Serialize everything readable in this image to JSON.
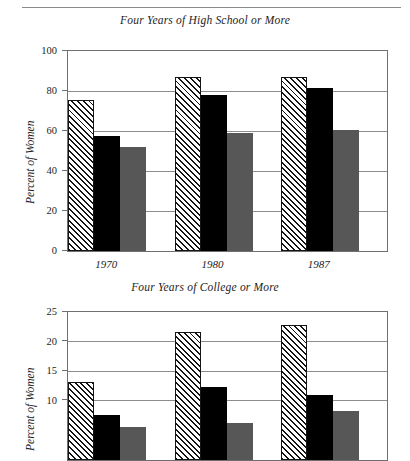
{
  "page": {
    "divider": "horizontal-rule"
  },
  "chart_data": [
    {
      "id": "high-school",
      "type": "bar",
      "title": "Four Years of High School or More",
      "xlabel": "",
      "ylabel": "Percent of Women",
      "ylim": [
        0,
        100
      ],
      "yticks": [
        0,
        20,
        40,
        60,
        80,
        100
      ],
      "ytick_labels": [
        "0",
        "20",
        "40",
        "60",
        "80",
        "100"
      ],
      "grid": true,
      "legend": "none",
      "categories": [
        "1970",
        "1980",
        "1987"
      ],
      "series": [
        {
          "name": "series-1",
          "style": "hatched",
          "color": "#ffffff",
          "values": [
            75.5,
            87.0,
            87.0
          ]
        },
        {
          "name": "series-2",
          "style": "solid-black",
          "color": "#000000",
          "values": [
            57.6,
            78.0,
            81.5
          ]
        },
        {
          "name": "series-3",
          "style": "solid-gray",
          "color": "#575757",
          "values": [
            52.0,
            58.8,
            60.6
          ]
        }
      ]
    },
    {
      "id": "college",
      "type": "bar",
      "title": "Four Years of College or More",
      "xlabel": "",
      "ylabel": "Percent of Women",
      "ylim": [
        0,
        25
      ],
      "yticks": [
        10,
        15,
        20,
        25
      ],
      "ytick_labels": [
        "10",
        "15",
        "20",
        "25"
      ],
      "grid": true,
      "legend": "none",
      "categories": [
        "1970",
        "1980",
        "1987"
      ],
      "series": [
        {
          "name": "series-1",
          "style": "hatched",
          "color": "#ffffff",
          "values": [
            13.2,
            21.7,
            22.8
          ]
        },
        {
          "name": "series-2",
          "style": "solid-black",
          "color": "#000000",
          "values": [
            7.6,
            12.4,
            11.0
          ]
        },
        {
          "name": "series-3",
          "style": "solid-gray",
          "color": "#575757",
          "values": [
            5.6,
            6.3,
            8.2
          ]
        }
      ]
    }
  ]
}
